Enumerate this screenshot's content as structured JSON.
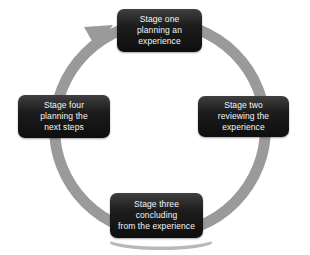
{
  "diagram": {
    "type": "cycle",
    "direction": "clockwise",
    "stages": [
      {
        "id": "stage-one",
        "position": "top",
        "label": "Stage one\nplanning an\nexperience"
      },
      {
        "id": "stage-two",
        "position": "right",
        "label": "Stage two\nreviewing the\nexperience"
      },
      {
        "id": "stage-three",
        "position": "bottom",
        "label": "Stage three\nconcluding\nfrom the experience"
      },
      {
        "id": "stage-four",
        "position": "left",
        "label": "Stage four\nplanning the\nnext steps"
      }
    ],
    "colors": {
      "ring": "#9a9a9a",
      "shadow": "#b8b8b8",
      "box_dark": "#0e0e0e",
      "text": "#f5f5f5",
      "background": "#ffffff"
    }
  }
}
